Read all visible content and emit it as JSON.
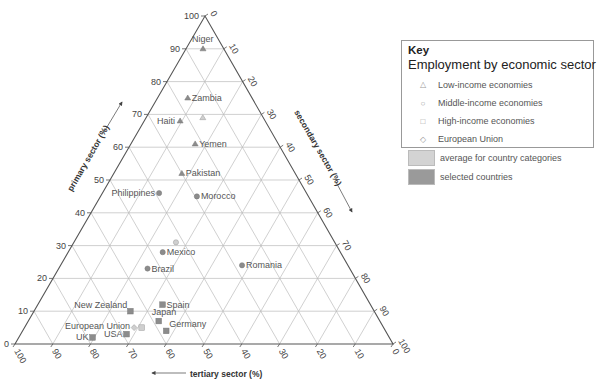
{
  "chart_data": {
    "type": "ternary-scatter",
    "title": "Employment by economic sector",
    "axes": {
      "primary": {
        "label": "primary sector (%)",
        "ticks": [
          0,
          10,
          20,
          30,
          40,
          50,
          60,
          70,
          80,
          90,
          100
        ]
      },
      "secondary": {
        "label": "secondary sector (%)",
        "ticks": [
          0,
          10,
          20,
          30,
          40,
          50,
          60,
          70,
          80,
          90,
          100
        ]
      },
      "tertiary": {
        "label": "tertiary sector (%)",
        "ticks": [
          100,
          90,
          80,
          70,
          60,
          50,
          40,
          30,
          20,
          10,
          0
        ]
      }
    },
    "grid": true,
    "legend_position": "right",
    "points": [
      {
        "label": "Niger",
        "category": "low",
        "kind": "selected",
        "primary": 90,
        "secondary": 4.5,
        "tertiary": 5.5
      },
      {
        "label": "Zambia",
        "category": "low",
        "kind": "selected",
        "primary": 75,
        "secondary": 8,
        "tertiary": 17
      },
      {
        "label": "Haiti",
        "category": "low",
        "kind": "selected",
        "primary": 68,
        "secondary": 9.5,
        "tertiary": 22.5
      },
      {
        "label": "",
        "category": "low",
        "kind": "average",
        "primary": 69,
        "secondary": 15,
        "tertiary": 16
      },
      {
        "label": "Yemen",
        "category": "low",
        "kind": "selected",
        "primary": 61,
        "secondary": 17,
        "tertiary": 22
      },
      {
        "label": "Pakistan",
        "category": "low",
        "kind": "selected",
        "primary": 52,
        "secondary": 18,
        "tertiary": 30
      },
      {
        "label": "Philippines",
        "category": "middle",
        "kind": "selected",
        "primary": 46,
        "secondary": 15,
        "tertiary": 39
      },
      {
        "label": "Morocco",
        "category": "middle",
        "kind": "selected",
        "primary": 45,
        "secondary": 25.5,
        "tertiary": 29.5
      },
      {
        "label": "",
        "category": "middle",
        "kind": "average",
        "primary": 31,
        "secondary": 27,
        "tertiary": 42
      },
      {
        "label": "Mexico",
        "category": "middle",
        "kind": "selected",
        "primary": 28,
        "secondary": 25,
        "tertiary": 47
      },
      {
        "label": "Brazil",
        "category": "middle",
        "kind": "selected",
        "primary": 23,
        "secondary": 23.5,
        "tertiary": 53.5
      },
      {
        "label": "Romania",
        "category": "middle",
        "kind": "selected",
        "primary": 24,
        "secondary": 48,
        "tertiary": 28
      },
      {
        "label": "Spain",
        "category": "high",
        "kind": "selected",
        "primary": 12,
        "secondary": 33,
        "tertiary": 55
      },
      {
        "label": "New Zealand",
        "category": "high",
        "kind": "selected",
        "primary": 10,
        "secondary": 25.5,
        "tertiary": 64.5
      },
      {
        "label": "Japan",
        "category": "high",
        "kind": "selected",
        "primary": 7,
        "secondary": 34.5,
        "tertiary": 58.5
      },
      {
        "label": "Germany",
        "category": "high",
        "kind": "selected",
        "primary": 4,
        "secondary": 38,
        "tertiary": 58
      },
      {
        "label": "European Union",
        "category": "eu",
        "kind": "average",
        "primary": 5,
        "secondary": 29,
        "tertiary": 66
      },
      {
        "label": "",
        "category": "high",
        "kind": "average",
        "primary": 5,
        "secondary": 31,
        "tertiary": 64
      },
      {
        "label": "USA",
        "category": "high",
        "kind": "selected",
        "primary": 3,
        "secondary": 28,
        "tertiary": 69
      },
      {
        "label": "UK",
        "category": "high",
        "kind": "selected",
        "primary": 2,
        "secondary": 19.5,
        "tertiary": 78.5
      }
    ]
  },
  "key": {
    "title": "Key",
    "subtitle": "Employment by economic sector",
    "items": [
      {
        "symbol": "△",
        "label": "Low-income economies"
      },
      {
        "symbol": "○",
        "label": "Middle-income economies"
      },
      {
        "symbol": "□",
        "label": "High-income economies"
      },
      {
        "symbol": "◇",
        "label": "European Union"
      }
    ],
    "swatches": [
      {
        "color": "#d3d3d3",
        "label": "average for country categories"
      },
      {
        "color": "#9a9a9a",
        "label": "selected countries"
      }
    ]
  },
  "colors": {
    "axis": "#555555",
    "grid": "#bbbbbb",
    "selected": "#8c8c8c",
    "average": "#cfcfcf"
  }
}
